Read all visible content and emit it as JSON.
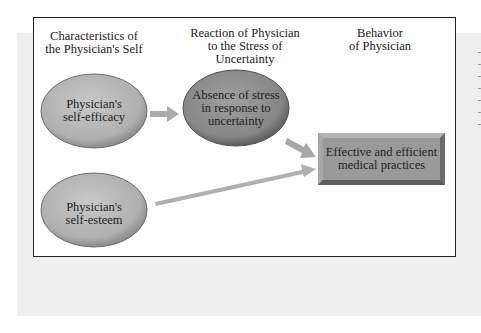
{
  "diagram": {
    "columns": [
      {
        "line1": "Characteristics of",
        "line2": "the Physician's Self"
      },
      {
        "line1": "Reaction of Physician",
        "line2": "to the Stress of",
        "line3": "Uncertainty"
      },
      {
        "line1": "Behavior",
        "line2": "of Physician"
      }
    ],
    "nodes": [
      {
        "id": "self-efficacy",
        "shape": "ellipse",
        "line1": "Physician's",
        "line2": "self-efficacy",
        "fill": "#b9b9b9"
      },
      {
        "id": "absence-of-stress",
        "shape": "ellipse",
        "line1": "Absence of stress",
        "line2": "in response to",
        "line3": "uncertainty",
        "fill": "#8f8f8f"
      },
      {
        "id": "self-esteem",
        "shape": "ellipse",
        "line1": "Physician's",
        "line2": "self-esteem",
        "fill": "#bdbdbd"
      },
      {
        "id": "effective-practices",
        "shape": "beveled-rectangle",
        "line1": "Effective and efficient",
        "line2": "medical practices",
        "fill": "#9a9a9a"
      }
    ],
    "edges": [
      {
        "from": "self-efficacy",
        "to": "absence-of-stress"
      },
      {
        "from": "absence-of-stress",
        "to": "effective-practices"
      },
      {
        "from": "self-esteem",
        "to": "effective-practices"
      }
    ],
    "arrow_color": "#a9a9a9"
  }
}
